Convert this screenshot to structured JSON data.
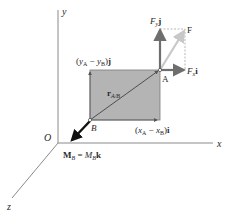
{
  "diagram": {
    "type": "vector-mechanics-figure",
    "axes": {
      "x_label": "x",
      "y_label": "y",
      "z_label": "z",
      "origin_label": "O"
    },
    "points": {
      "A": "A",
      "B": "B"
    },
    "labels": {
      "position_vector": "r",
      "position_vector_sub": "A/B",
      "y_component": "(y",
      "y_component_full": "(yA − yB)j",
      "x_component_full": "(xA − xB)i",
      "force": "F",
      "force_y": "Fy j",
      "force_x": "Fx i",
      "moment": "MB = MB k"
    },
    "colors": {
      "rectangle_fill": "#b4b4b4",
      "rectangle_stroke": "#7a7a7a",
      "axis": "#8a8a8a",
      "force_component": "#6e6e6e",
      "force_resultant": "#c8c8c8",
      "moment_arrow": "#111111",
      "text": "#2a2a2a"
    }
  }
}
